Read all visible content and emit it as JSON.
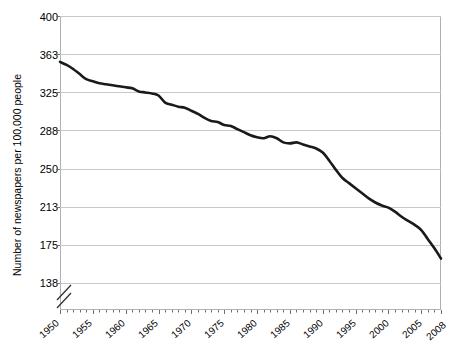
{
  "chart_data": {
    "type": "line",
    "title": "",
    "xlabel": "",
    "ylabel": "Number of newspapers per 100,000 people",
    "xlim": [
      1950,
      2008
    ],
    "ylim": [
      138,
      400
    ],
    "y_axis_break": true,
    "grid": "horizontal",
    "legend": "none",
    "line_color": "#1a1a1a",
    "ytick_labels": [
      "400",
      "363",
      "325",
      "288",
      "250",
      "213",
      "175",
      "138"
    ],
    "ytick_values": [
      400,
      363,
      325,
      288,
      250,
      213,
      175,
      138
    ],
    "xtick_labels": [
      "1950",
      "1955",
      "1960",
      "1965",
      "1970",
      "1975",
      "1980",
      "1985",
      "1990",
      "1995",
      "2000",
      "2005",
      "2008"
    ],
    "xtick_values": [
      1950,
      1955,
      1960,
      1965,
      1970,
      1975,
      1980,
      1985,
      1990,
      1995,
      2000,
      2005,
      2008
    ],
    "x": [
      1950,
      1951,
      1952,
      1953,
      1954,
      1955,
      1956,
      1957,
      1958,
      1959,
      1960,
      1961,
      1962,
      1963,
      1964,
      1965,
      1966,
      1967,
      1968,
      1969,
      1970,
      1971,
      1972,
      1973,
      1974,
      1975,
      1976,
      1977,
      1978,
      1979,
      1980,
      1981,
      1982,
      1983,
      1984,
      1985,
      1986,
      1987,
      1988,
      1989,
      1990,
      1991,
      1992,
      1993,
      1994,
      1995,
      1996,
      1997,
      1998,
      1999,
      2000,
      2001,
      2002,
      2003,
      2004,
      2005,
      2006,
      2007,
      2008
    ],
    "values": [
      355,
      352,
      348,
      343,
      338,
      336,
      334,
      333,
      332,
      331,
      330,
      329,
      326,
      325,
      324,
      322,
      315,
      313,
      311,
      310,
      307,
      304,
      300,
      297,
      296,
      293,
      292,
      289,
      286,
      283,
      281,
      280,
      282,
      280,
      276,
      275,
      276,
      274,
      272,
      270,
      266,
      258,
      249,
      241,
      236,
      231,
      226,
      221,
      217,
      214,
      212,
      208,
      203,
      199,
      195,
      190,
      181,
      172,
      162
    ],
    "series_name": "Newspapers per 100,000 people"
  },
  "plot_geometry": {
    "left": 60,
    "right": 441,
    "top": 16,
    "bottom": 310,
    "break_top": 283,
    "break_bottom": 306
  }
}
